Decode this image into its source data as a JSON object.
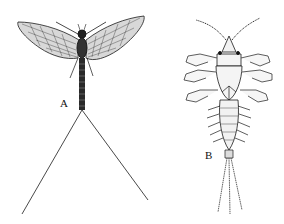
{
  "figure": {
    "panels": [
      {
        "label": "A",
        "subject": "adult mayfly (dorsal view, wings spread, two long cerci)"
      },
      {
        "label": "B",
        "subject": "mayfly nymph (dorsal view, abdominal gills, three caudal filaments)"
      }
    ],
    "colors": {
      "background": "#ffffff",
      "ink": "#1a1a1a"
    }
  }
}
